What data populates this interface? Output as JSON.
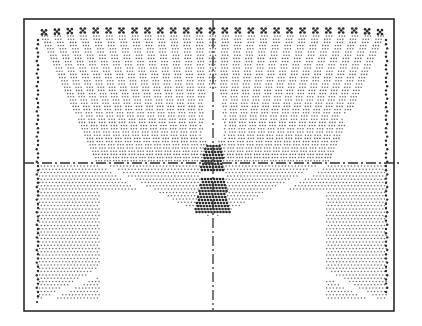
{
  "figure": {
    "colors": {
      "background": "#ffffff",
      "frame": "#2a2a2a",
      "dot_light": "#6a6a6a",
      "dot_dense": "#2b2b2b",
      "crosshair": "#333333"
    },
    "top_row_cluster_count": 27,
    "fan_strip_count": 27,
    "crosshair": {
      "vertical": true,
      "horizontal": true,
      "style": "dash-dot"
    }
  }
}
